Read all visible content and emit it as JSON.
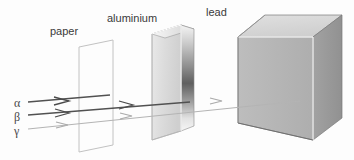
{
  "figure": {
    "background_color": "#fdfdfd"
  },
  "barriers": [
    {
      "id": "paper",
      "label": "paper",
      "label_x": 50,
      "label_y": 35,
      "type": "thin-sheet",
      "outline_color": "#b9b9b9",
      "fill_color": "none",
      "blocks": "alpha"
    },
    {
      "id": "aluminium",
      "label": "aluminium",
      "label_x": 107,
      "label_y": 22,
      "type": "slab",
      "face_color": "#d6d6d6",
      "edge_color": "#8a8a8a",
      "gradient_light": "#f2f2f2",
      "gradient_dark": "#6e6e6e",
      "blocks": "beta"
    },
    {
      "id": "lead",
      "label": "lead",
      "label_x": 206,
      "label_y": 16,
      "type": "cube",
      "top_face_color": "#d9d9d9",
      "front_face_color": "#b3b3b3",
      "side_face_color": "#9a9a9a",
      "edge_color": "#6f6f6f",
      "blocks": "gamma"
    }
  ],
  "rays": [
    {
      "id": "alpha",
      "label": "α",
      "label_x": 16,
      "label_y": 107,
      "color": "#4a4a4a",
      "stroke_width": 1.5,
      "start_x": 28,
      "y": 102,
      "stop_x": 108,
      "stopped_by": "paper"
    },
    {
      "id": "beta",
      "label": "β",
      "label_x": 16,
      "label_y": 121,
      "color": "#4a4a4a",
      "stroke_width": 1.5,
      "start_x": 28,
      "y": 115,
      "stop_x": 188,
      "stopped_by": "aluminium"
    },
    {
      "id": "gamma",
      "label": "γ",
      "label_x": 16,
      "label_y": 135,
      "color": "#b0b0b0",
      "stroke_width": 1.2,
      "start_x": 28,
      "y": 129,
      "stop_x": 300,
      "stopped_by": "lead"
    }
  ],
  "arrowheads": [
    {
      "ray": "alpha",
      "x": 64,
      "y": 101
    },
    {
      "ray": "beta",
      "x": 64,
      "y": 113
    },
    {
      "ray": "gamma",
      "x": 64,
      "y": 125
    },
    {
      "ray": "beta",
      "x": 128,
      "y": 105
    },
    {
      "ray": "gamma",
      "x": 128,
      "y": 116
    },
    {
      "ray": "gamma",
      "x": 218,
      "y": 101
    }
  ]
}
